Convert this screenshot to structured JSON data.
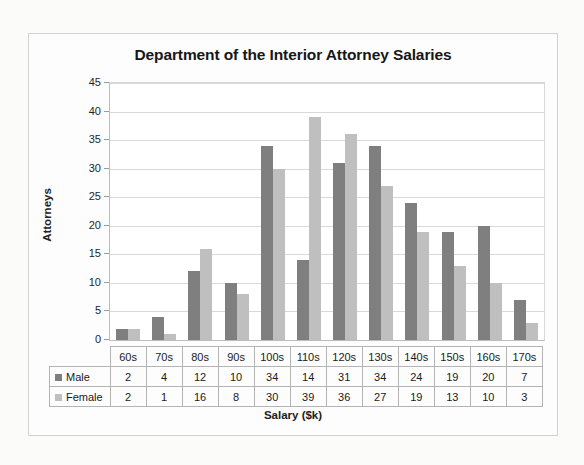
{
  "chart_data": {
    "type": "bar",
    "title": "Department of the Interior Attorney Salaries",
    "xlabel": "Salary ($k)",
    "ylabel": "Attorneys",
    "categories": [
      "60s",
      "70s",
      "80s",
      "90s",
      "100s",
      "110s",
      "120s",
      "130s",
      "140s",
      "150s",
      "160s",
      "170s"
    ],
    "series": [
      {
        "name": "Male",
        "color": "#7f7f7f",
        "values": [
          2,
          4,
          12,
          10,
          34,
          14,
          31,
          34,
          24,
          19,
          20,
          7
        ]
      },
      {
        "name": "Female",
        "color": "#bfbfbf",
        "values": [
          2,
          1,
          16,
          8,
          30,
          39,
          36,
          27,
          19,
          13,
          10,
          3
        ]
      }
    ],
    "ylim": [
      0,
      45
    ],
    "yticks": [
      0,
      5,
      10,
      15,
      20,
      25,
      30,
      35,
      40,
      45
    ],
    "ytick_labels": [
      "0",
      "5",
      "10",
      "15",
      "20",
      "25",
      "30",
      "35",
      "40",
      "45"
    ],
    "grid": "horizontal",
    "legend_position": "data-table-left",
    "has_data_table": true
  },
  "table": {
    "header_row": [
      "60s",
      "70s",
      "80s",
      "90s",
      "100s",
      "110s",
      "120s",
      "130s",
      "140s",
      "150s",
      "160s",
      "170s"
    ],
    "rows": [
      {
        "label": "Male",
        "swatch": "male-swatch-icon",
        "values": [
          "2",
          "4",
          "12",
          "10",
          "34",
          "14",
          "31",
          "34",
          "24",
          "19",
          "20",
          "7"
        ]
      },
      {
        "label": "Female",
        "swatch": "female-swatch-icon",
        "values": [
          "2",
          "1",
          "16",
          "8",
          "30",
          "39",
          "36",
          "27",
          "19",
          "13",
          "10",
          "3"
        ]
      }
    ]
  },
  "colors": {
    "male": "#7f7f7f",
    "female": "#bfbfbf",
    "gridline": "#d9d9d9",
    "frame": "#d2d2d2",
    "page_background": "#fbfbfa"
  }
}
